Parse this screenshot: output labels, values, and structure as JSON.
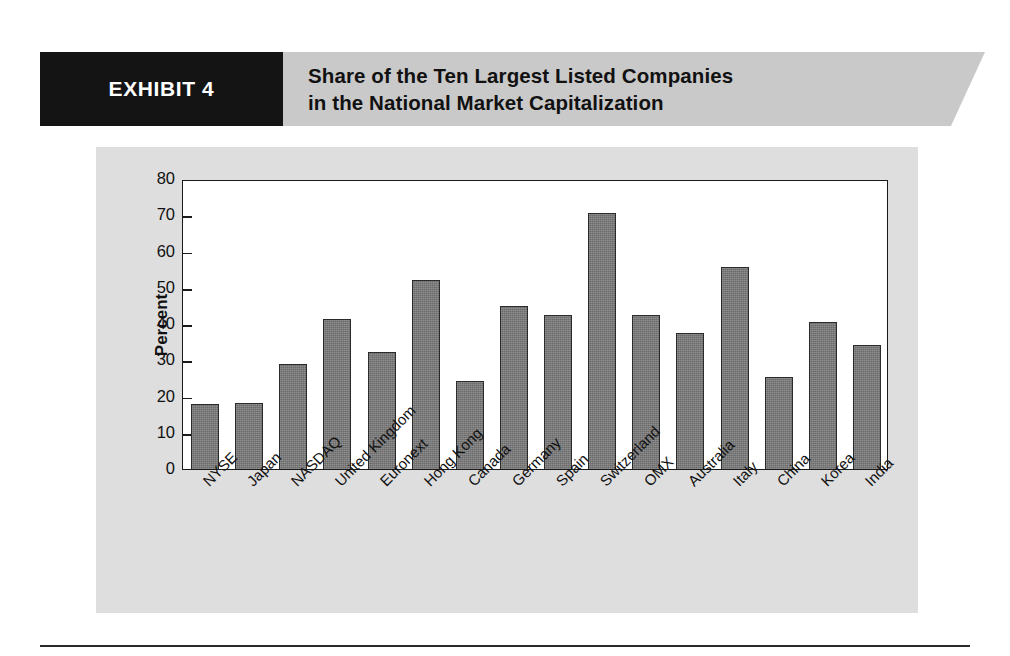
{
  "exhibit": {
    "tag": "EXHIBIT 4",
    "title": "Share of the Ten Largest Listed Companies\nin the National Market Capitalization"
  },
  "colors": {
    "banner_background": "#c9c9c9",
    "tag_background": "#141414",
    "tag_text": "#ffffff",
    "panel_background": "#dedede",
    "plot_background": "#ffffff",
    "bar_fill": "#6b6b6b",
    "bar_outline": "#2b2b2b",
    "axis": "#1a1a1a"
  },
  "chart_data": {
    "type": "bar",
    "title": "Share of the Ten Largest Listed Companies in the National Market Capitalization",
    "xlabel": "",
    "ylabel": "Percent",
    "ylim": [
      0,
      80
    ],
    "yticks": [
      0,
      10,
      20,
      30,
      40,
      50,
      60,
      70,
      80
    ],
    "grid": false,
    "legend": null,
    "categories": [
      "NYSE",
      "Japan",
      "NASDAQ",
      "United Kingdom",
      "Euronext",
      "Hong Kong",
      "Canada",
      "Germany",
      "Spain",
      "Switzerland",
      "OMX",
      "Australia",
      "Italy",
      "China",
      "Korea",
      "India"
    ],
    "values": [
      18.0,
      18.1,
      29.1,
      41.4,
      32.2,
      52.2,
      24.2,
      45.0,
      42.4,
      70.5,
      42.5,
      37.4,
      55.6,
      25.4,
      40.5,
      34.3
    ]
  }
}
